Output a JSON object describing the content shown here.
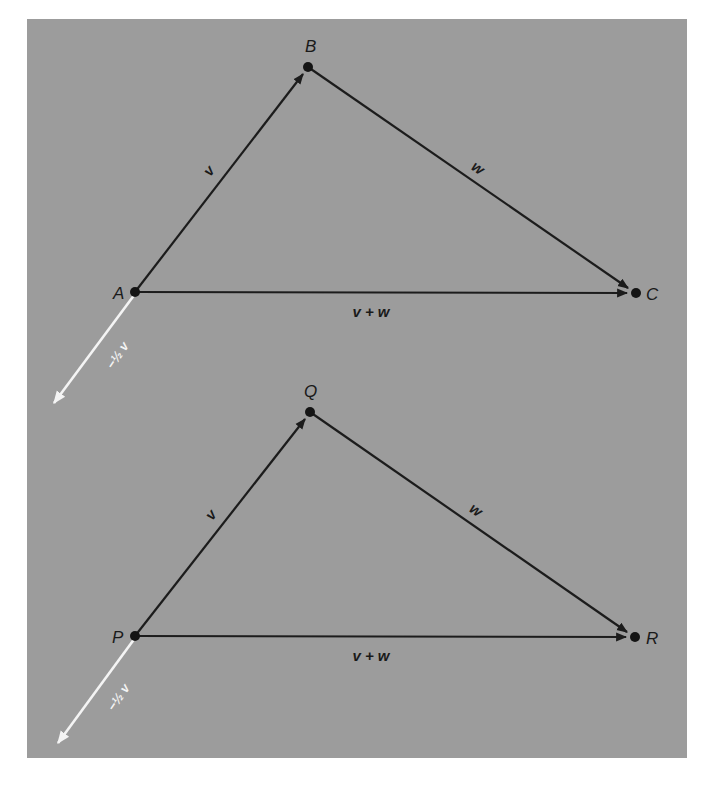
{
  "colors": {
    "background": "#ffffff",
    "panel": "#9c9c9c",
    "vector": "#1c1c1c",
    "scaled_vector": "#f4f4f4"
  },
  "panel": {
    "x": 27,
    "y": 19,
    "width": 660,
    "height": 739
  },
  "diagrams": [
    {
      "name": "top",
      "points": {
        "start": {
          "label": "A",
          "x": 135,
          "y": 292
        },
        "mid": {
          "label": "B",
          "x": 308,
          "y": 67
        },
        "end": {
          "label": "C",
          "x": 636,
          "y": 293
        }
      },
      "labels": {
        "v": "v",
        "w": "w",
        "sum": "v + w",
        "scaled": "−½ v"
      },
      "scaled_tip": {
        "x": 53,
        "y": 404
      }
    },
    {
      "name": "bottom",
      "points": {
        "start": {
          "label": "P",
          "x": 135,
          "y": 636
        },
        "mid": {
          "label": "Q",
          "x": 310,
          "y": 412
        },
        "end": {
          "label": "R",
          "x": 635,
          "y": 637
        }
      },
      "labels": {
        "v": "v",
        "w": "w",
        "sum": "v + w",
        "scaled": "−½ v"
      },
      "scaled_tip": {
        "x": 57,
        "y": 744
      }
    }
  ]
}
